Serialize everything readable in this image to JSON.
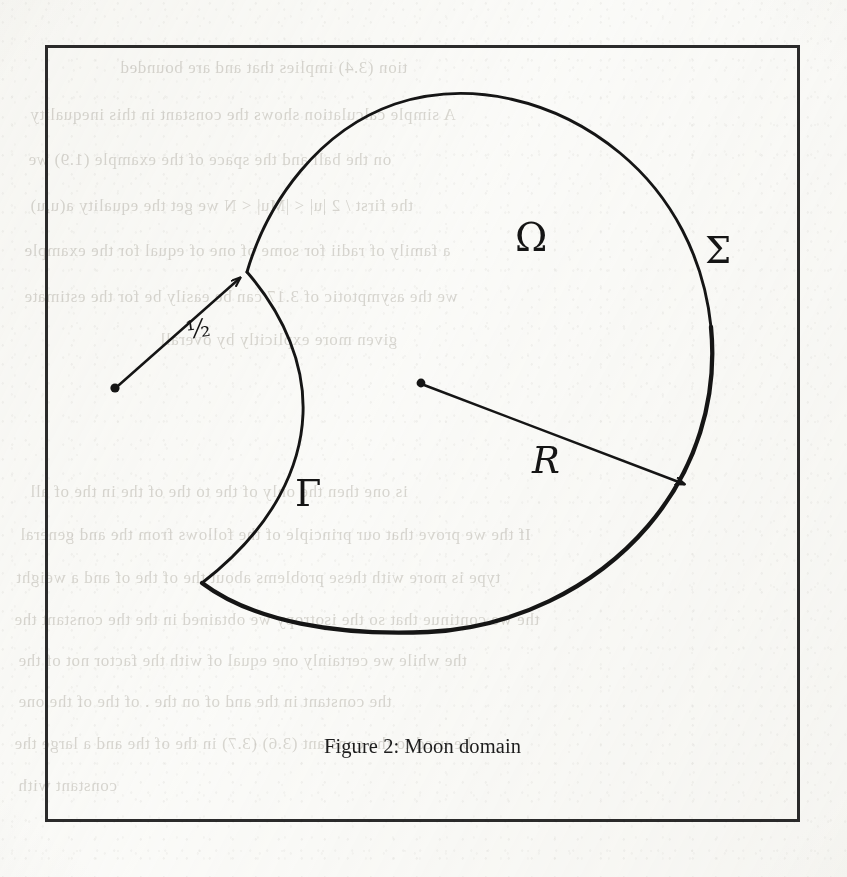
{
  "page": {
    "background_color": "#fbfbf9",
    "ink_color": "#151515",
    "frame_color": "#2b2b2b",
    "width": 847,
    "height": 877
  },
  "figure": {
    "caption_label": "Figure 2:",
    "caption_text": "Moon domain",
    "frame": {
      "x": 45,
      "y": 45,
      "width": 755,
      "height": 777,
      "stroke_width": 3
    }
  },
  "diagram": {
    "title": "Moon domain",
    "labels": {
      "omega": "Ω",
      "sigma": "Σ",
      "gamma": "Γ",
      "radius_big": "R",
      "radius_small": "½"
    },
    "label_meanings": {
      "omega": "interior of the moon domain",
      "sigma": "outer circular boundary arc",
      "gamma": "inner concave boundary arc",
      "radius_big": "radius of the large circle",
      "radius_small": "radius of the removed disk"
    },
    "geometry": {
      "big_circle": {
        "cx": 421,
        "cy": 383,
        "r": 291,
        "center_dot": true
      },
      "small_circle": {
        "cx": 115,
        "cy": 388,
        "r": 166,
        "center_dot": true
      },
      "big_radius_arrow": {
        "x1": 421,
        "y1": 383,
        "x2": 690,
        "y2": 487
      },
      "small_radius_arrow": {
        "x1": 115,
        "y1": 388,
        "x2": 245,
        "y2": 273
      },
      "arc_junctions": [
        {
          "x": 247,
          "y": 272
        },
        {
          "x": 202,
          "y": 583
        }
      ]
    }
  },
  "bleed_through": {
    "note": "faint mirrored show-through text from the reverse side of the scanned page",
    "lines": [
      {
        "text": "tion (3.4) implies that   and     are    bounded",
        "x": 120,
        "y": 58,
        "size": 17
      },
      {
        "text": "A simple calculation shows the constant in this inequality",
        "x": 30,
        "y": 105,
        "size": 17
      },
      {
        "text": "on the ball   and the space    of    the  example (1.9) we",
        "x": 28,
        "y": 150,
        "size": 17
      },
      {
        "text": "the first  / 2  |u| < |Mu| < N   we get the  equality  a(u,u)",
        "x": 30,
        "y": 196,
        "size": 17
      },
      {
        "text": "a family of radii   for some   of   one of  equal for the example",
        "x": 24,
        "y": 241,
        "size": 17
      },
      {
        "text": "we   the asymptotic   of  3.17  can be   easily be    for  the  estimate",
        "x": 24,
        "y": 287,
        "size": 17
      },
      {
        "text": "given   more  explicitly  by  overall",
        "x": 160,
        "y": 330,
        "size": 17
      },
      {
        "text": "is one then   the only   of the      to the     of the   in   the   of   all",
        "x": 30,
        "y": 482,
        "size": 17
      },
      {
        "text": "If the    we  prove that  our principle  of the    follows from  the    and  general",
        "x": 20,
        "y": 525,
        "size": 17
      },
      {
        "text": "type is   more with  these    problems   about the    of        the   of     and  a   weight",
        "x": 16,
        "y": 568,
        "size": 17
      },
      {
        "text": "the   we  continue   that   so  the   isotropy  we  obtained   in   the    the    constant  the",
        "x": 14,
        "y": 610,
        "size": 17
      },
      {
        "text": "the   while  we  certainly    one   equal  of        with   the  factor  not   of        the",
        "x": 18,
        "y": 651,
        "size": 17
      },
      {
        "text": "the    constant    in the     and    of       on     the    .   of    the      of    the   one",
        "x": 18,
        "y": 692,
        "size": 17
      },
      {
        "text": "be used to   the   constant  (3.6)  (3.7)   in     the    of  the      and  a      large  the",
        "x": 14,
        "y": 734,
        "size": 17
      },
      {
        "text": "constant with",
        "x": 18,
        "y": 776,
        "size": 17
      }
    ]
  }
}
